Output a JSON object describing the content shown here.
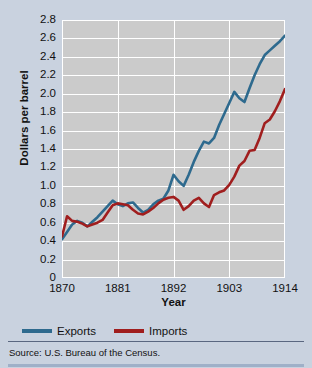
{
  "chart_data": {
    "type": "line",
    "title": "",
    "xlabel": "Year",
    "ylabel": "Dollars per barrel",
    "xlim": [
      1870,
      1914
    ],
    "ylim": [
      0,
      2.8
    ],
    "grid": true,
    "legend_position": "bottom-left",
    "xticks": [
      "1870",
      "1881",
      "1892",
      "1903",
      "1914"
    ],
    "xtick_values": [
      1870,
      1881,
      1892,
      1903,
      1914
    ],
    "yticks": [
      "0",
      "0.2",
      "0.4",
      "0.6",
      "0.8",
      "1.0",
      "1.2",
      "1.4",
      "1.6",
      "1.8",
      "2.0",
      "2.2",
      "2.4",
      "2.6",
      "2.8"
    ],
    "ytick_values": [
      0,
      0.2,
      0.4,
      0.6,
      0.8,
      1.0,
      1.2,
      1.4,
      1.6,
      1.8,
      2.0,
      2.2,
      2.4,
      2.6,
      2.8
    ],
    "x": [
      1870,
      1871,
      1872,
      1873,
      1874,
      1875,
      1876,
      1877,
      1878,
      1879,
      1880,
      1881,
      1882,
      1883,
      1884,
      1885,
      1886,
      1887,
      1888,
      1889,
      1890,
      1891,
      1892,
      1893,
      1894,
      1895,
      1896,
      1897,
      1898,
      1899,
      1900,
      1901,
      1902,
      1903,
      1904,
      1905,
      1906,
      1907,
      1908,
      1909,
      1910,
      1911,
      1912,
      1913,
      1914
    ],
    "series": [
      {
        "name": "Exports",
        "color": "#2e6a8e",
        "values": [
          0.42,
          0.5,
          0.58,
          0.62,
          0.6,
          0.56,
          0.61,
          0.66,
          0.72,
          0.78,
          0.84,
          0.8,
          0.78,
          0.81,
          0.82,
          0.76,
          0.71,
          0.74,
          0.8,
          0.84,
          0.86,
          0.95,
          1.12,
          1.05,
          1.0,
          1.12,
          1.26,
          1.38,
          1.48,
          1.46,
          1.52,
          1.66,
          1.78,
          1.9,
          2.02,
          1.95,
          1.91,
          2.06,
          2.2,
          2.32,
          2.42,
          2.47,
          2.52,
          2.57,
          2.63
        ]
      },
      {
        "name": "Imports",
        "color": "#a01e1e",
        "values": [
          0.45,
          0.67,
          0.62,
          0.61,
          0.59,
          0.56,
          0.58,
          0.6,
          0.63,
          0.71,
          0.79,
          0.81,
          0.8,
          0.79,
          0.74,
          0.7,
          0.69,
          0.72,
          0.76,
          0.81,
          0.85,
          0.87,
          0.88,
          0.84,
          0.74,
          0.78,
          0.84,
          0.87,
          0.81,
          0.77,
          0.9,
          0.93,
          0.95,
          1.01,
          1.1,
          1.22,
          1.27,
          1.38,
          1.39,
          1.52,
          1.68,
          1.72,
          1.81,
          1.92,
          2.05
        ]
      }
    ]
  },
  "legend": {
    "items": [
      {
        "label": "Exports",
        "color": "#2e6a8e"
      },
      {
        "label": "Imports",
        "color": "#a01e1e"
      }
    ]
  },
  "source": {
    "text": "Source: U.S. Bureau of the Census."
  }
}
